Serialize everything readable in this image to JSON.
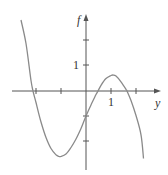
{
  "chart_data": {
    "type": "line",
    "title": "",
    "xlabel": "y",
    "ylabel": "f",
    "x_tick_labels": [
      {
        "value": 1,
        "label": "1"
      }
    ],
    "y_tick_labels": [
      {
        "value": 1,
        "label": "1"
      }
    ],
    "x_ticks": [
      -2,
      -1,
      1,
      2
    ],
    "y_ticks": [
      -2,
      -1,
      1,
      2
    ],
    "xlim": [
      -3,
      3
    ],
    "ylim": [
      -3.2,
      3.1
    ],
    "grid": false,
    "series": [
      {
        "name": "f(y)",
        "color": "#8a8a8a",
        "x": [
          -2.6,
          -2.4,
          -2.2,
          -2.12,
          -2.0,
          -1.8,
          -1.6,
          -1.4,
          -1.2,
          -1.08,
          -1.0,
          -0.8,
          -0.6,
          -0.4,
          -0.2,
          0.0,
          0.2,
          0.4,
          0.48,
          0.6,
          0.8,
          1.0,
          1.08,
          1.2,
          1.4,
          1.6,
          1.64,
          1.8,
          2.0,
          2.2,
          2.3
        ],
        "y": [
          2.84,
          1.9,
          0.42,
          0.0,
          -0.46,
          -1.24,
          -1.86,
          -2.3,
          -2.55,
          -2.62,
          -2.62,
          -2.52,
          -2.26,
          -1.92,
          -1.5,
          -1.0,
          -0.56,
          -0.14,
          0.0,
          0.23,
          0.5,
          0.62,
          0.64,
          0.6,
          0.37,
          0.07,
          0.0,
          -0.38,
          -0.98,
          -1.75,
          -2.7
        ]
      }
    ],
    "annotations": []
  }
}
